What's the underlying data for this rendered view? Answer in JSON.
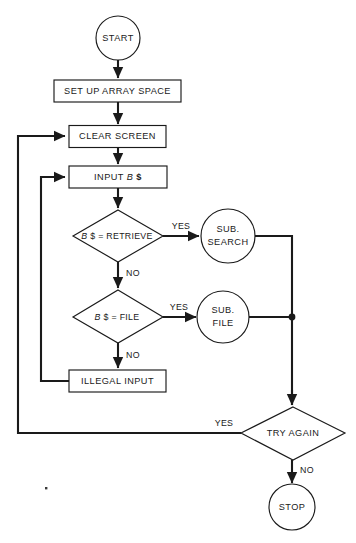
{
  "diagram": {
    "canvas": {
      "width": 356,
      "height": 543
    },
    "colors": {
      "background": "#ffffff",
      "stroke": "#1a1a1a",
      "shape_fill": "#ffffff"
    },
    "nodes": {
      "start": {
        "label": "START",
        "shape": "circle"
      },
      "setup": {
        "label": "SET UP ARRAY SPACE",
        "shape": "process"
      },
      "clear": {
        "label": "CLEAR SCREEN",
        "shape": "process"
      },
      "input": {
        "label_prefix": "INPUT ",
        "label_var": "B",
        "label_suffix": " $",
        "shape": "process"
      },
      "decision_retrieve": {
        "label_var": "B",
        "label_rest": " $ = RETRIEVE",
        "shape": "decision"
      },
      "sub_search": {
        "line1": "SUB.",
        "line2": "SEARCH",
        "shape": "circle"
      },
      "decision_file": {
        "label_var": "B",
        "label_rest": " $ = FILE",
        "shape": "decision"
      },
      "sub_file": {
        "line1": "SUB.",
        "line2": "FILE",
        "shape": "circle"
      },
      "illegal": {
        "label": "ILLEGAL INPUT",
        "shape": "process"
      },
      "try_again": {
        "label": "TRY AGAIN",
        "shape": "decision"
      },
      "stop": {
        "label": "STOP",
        "shape": "circle"
      }
    },
    "edge_labels": {
      "retrieve_yes": "YES",
      "retrieve_no": "NO",
      "file_yes": "YES",
      "file_no": "NO",
      "try_again_yes": "YES",
      "try_again_no": "NO"
    }
  }
}
